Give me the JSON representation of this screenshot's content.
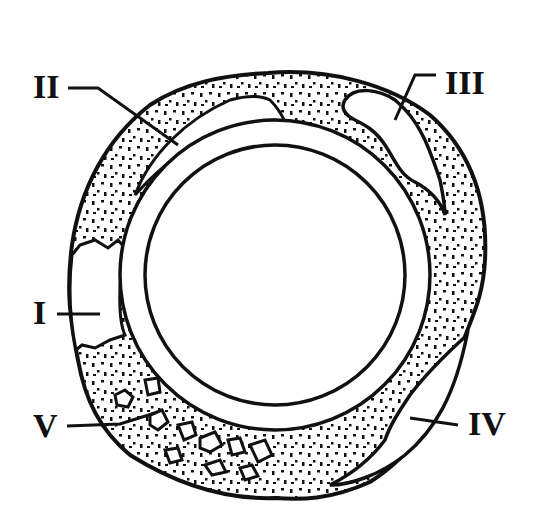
{
  "diagram": {
    "type": "cross-section",
    "colors": {
      "ink": "#111111",
      "background": "#ffffff"
    },
    "labels": [
      {
        "id": "I",
        "text": "I"
      },
      {
        "id": "II",
        "text": "II"
      },
      {
        "id": "III",
        "text": "III"
      },
      {
        "id": "IV",
        "text": "IV"
      },
      {
        "id": "V",
        "text": "V"
      }
    ]
  }
}
